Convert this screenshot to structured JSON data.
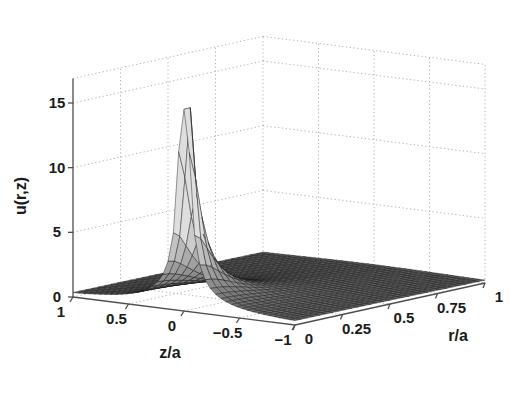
{
  "figure": {
    "background_color": "#ffffff",
    "axis_line_color": "#4d4d4d",
    "grid_color": "#b0b0b0",
    "mesh_line_color": "#1a1a1a",
    "surface_fill_light": "#d9d9d9",
    "surface_fill_mid": "#9e9e9e",
    "surface_fill_dark": "#6b6b6b"
  },
  "chart_data": {
    "type": "surface",
    "title": "",
    "xlabel": "z/a",
    "ylabel": "r/a",
    "zlabel": "u(r,z)",
    "xlim": [
      1,
      -1
    ],
    "ylim": [
      0,
      1
    ],
    "zlim": [
      0,
      15
    ],
    "grid": true,
    "legend": "none",
    "x_ticks": [
      "1",
      "0.5",
      "0",
      "-0.5",
      "-1"
    ],
    "x_tick_values": [
      1,
      0.5,
      0,
      -0.5,
      -1
    ],
    "y_ticks": [
      "0",
      "0.25",
      "0.5",
      "0.75",
      "1"
    ],
    "y_tick_values": [
      0,
      0.25,
      0.5,
      0.75,
      1
    ],
    "z_ticks": [
      "0",
      "5",
      "10",
      "15"
    ],
    "z_tick_values": [
      0,
      5,
      10,
      15
    ],
    "peak": {
      "r_over_a": 0.0,
      "z_over_a": 0.0,
      "u": 15.6
    },
    "surface_model": {
      "form": "A / ((r/a)^2 + (z/a)^2 + eps)^p",
      "A": 0.34,
      "eps": 0.0008,
      "p": 0.62,
      "clamp_max": 15.6
    },
    "samples": {
      "note": "u(r,z) sampled on a grid; rows are r/a, columns are z/a",
      "r_over_a": [
        0,
        0.1,
        0.2,
        0.3,
        0.4,
        0.5,
        0.6,
        0.7,
        0.8,
        0.9,
        1.0
      ],
      "z_over_a": [
        -1,
        -0.75,
        -0.5,
        -0.25,
        0,
        0.25,
        0.5,
        0.75,
        1
      ],
      "values": [
        [
          0.33,
          0.41,
          0.55,
          0.86,
          15.6,
          0.86,
          0.55,
          0.41,
          0.33
        ],
        [
          0.33,
          0.4,
          0.53,
          0.76,
          1.42,
          0.76,
          0.53,
          0.4,
          0.33
        ],
        [
          0.31,
          0.38,
          0.48,
          0.63,
          0.9,
          0.63,
          0.48,
          0.38,
          0.31
        ],
        [
          0.29,
          0.34,
          0.42,
          0.52,
          0.65,
          0.52,
          0.42,
          0.34,
          0.29
        ],
        [
          0.27,
          0.31,
          0.36,
          0.43,
          0.5,
          0.43,
          0.36,
          0.31,
          0.27
        ],
        [
          0.25,
          0.28,
          0.32,
          0.36,
          0.41,
          0.36,
          0.32,
          0.28,
          0.25
        ],
        [
          0.23,
          0.25,
          0.28,
          0.31,
          0.34,
          0.31,
          0.28,
          0.25,
          0.23
        ],
        [
          0.21,
          0.23,
          0.25,
          0.27,
          0.29,
          0.27,
          0.25,
          0.23,
          0.21
        ],
        [
          0.2,
          0.21,
          0.23,
          0.24,
          0.26,
          0.24,
          0.23,
          0.21,
          0.2
        ],
        [
          0.18,
          0.19,
          0.21,
          0.22,
          0.23,
          0.22,
          0.21,
          0.19,
          0.18
        ],
        [
          0.17,
          0.18,
          0.19,
          0.2,
          0.21,
          0.2,
          0.19,
          0.18,
          0.17
        ]
      ]
    }
  },
  "axes": {
    "z_axis": {
      "title": "u(r,z)",
      "ticks": [
        {
          "label": "15",
          "value": 15
        },
        {
          "label": "10",
          "value": 10
        },
        {
          "label": "5",
          "value": 5
        },
        {
          "label": "0",
          "value": 0
        }
      ]
    },
    "x_axis": {
      "title": "z/a",
      "ticks": [
        {
          "label": "1",
          "value": 1
        },
        {
          "label": "0.5",
          "value": 0.5
        },
        {
          "label": "0",
          "value": 0
        },
        {
          "label": "−0.5",
          "value": -0.5
        },
        {
          "label": "−1",
          "value": -1
        }
      ]
    },
    "y_axis": {
      "title": "r/a",
      "ticks": [
        {
          "label": "0",
          "value": 0
        },
        {
          "label": "0.25",
          "value": 0.25
        },
        {
          "label": "0.5",
          "value": 0.5
        },
        {
          "label": "0.75",
          "value": 0.75
        },
        {
          "label": "1",
          "value": 1
        }
      ]
    }
  }
}
